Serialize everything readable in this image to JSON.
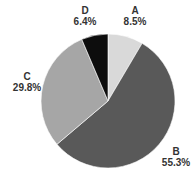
{
  "chart_data": {
    "type": "pie",
    "title": "",
    "categories": [
      "A",
      "B",
      "C",
      "D"
    ],
    "values": [
      8.5,
      55.3,
      29.8,
      6.4
    ],
    "labels": [
      "8.5%",
      "55.3%",
      "29.8%",
      "6.4%"
    ],
    "colors": [
      "#d9d9d9",
      "#595959",
      "#a6a6a6",
      "#0d0d0d"
    ],
    "start_angle": "12 o'clock",
    "direction": "clockwise",
    "legend": "none (labels beside slices)"
  },
  "labels": {
    "A": {
      "cat": "A",
      "pct": "8.5%"
    },
    "B": {
      "cat": "B",
      "pct": "55.3%"
    },
    "C": {
      "cat": "C",
      "pct": "29.8%"
    },
    "D": {
      "cat": "D",
      "pct": "6.4%"
    }
  }
}
